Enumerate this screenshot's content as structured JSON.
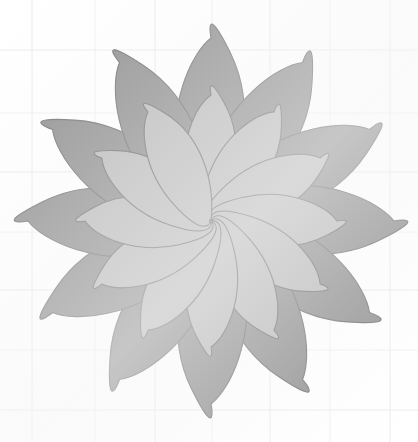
{
  "figure": {
    "kind": "geometric-flower-diagram",
    "medium": "scanned line drawing on graph paper",
    "canvas": {
      "width": 418,
      "height": 442,
      "background_color": "#ffffff"
    },
    "center": {
      "x": 211,
      "y": 221
    }
  },
  "palette": {
    "background": "#ffffff",
    "grid_line": "#f0f0f0",
    "grid_line_strong": "#eaeaea",
    "petal_outer_fill": "#8d8d8d",
    "petal_inner_fill": "#b9b9b9",
    "petal_stroke": "#6f6f6f",
    "paper_tint": "#f7f7f7"
  },
  "grid": {
    "visible": true,
    "spacing_px": 60,
    "vertical_lines_x": [
      32,
      95,
      155,
      212,
      270,
      330,
      390
    ],
    "horizontal_lines_y": [
      50,
      113,
      172,
      232,
      290,
      350,
      410
    ],
    "stroke_width": 1
  },
  "rosette": {
    "petal_count": 12,
    "angle_step_deg": 30,
    "start_angle_deg": 0,
    "outer_layer": {
      "label": "outer dark petal",
      "fill": "#8d8d8d",
      "stroke": "#6f6f6f",
      "stroke_width": 1.1,
      "tip_radius": 183,
      "half_width": 46,
      "waist_radius": 104
    },
    "inner_layer": {
      "label": "inner light petal",
      "fill": "#b9b9b9",
      "stroke": "#6f6f6f",
      "stroke_width": 1.1,
      "tip_radius": 126,
      "half_width": 34,
      "waist_radius": 72
    },
    "petal_angles_deg": [
      0,
      30,
      60,
      90,
      120,
      150,
      180,
      210,
      240,
      270,
      300,
      330
    ],
    "extents": {
      "top_tip_y": 38,
      "bottom_tip_y": 398,
      "left_tip_x": 48,
      "right_tip_x": 380
    }
  }
}
